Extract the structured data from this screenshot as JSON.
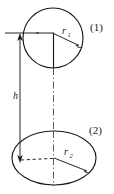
{
  "figure": {
    "type": "engineering-cross-section-diagram",
    "background_color": "#ffffff",
    "line_color": "#1a1a1a",
    "width": 114,
    "height": 194
  },
  "labels": {
    "section_top": "(1)",
    "section_bottom": "(2)",
    "height_symbol": "h",
    "radius_top_symbol": "r",
    "radius_top_subscript": "1",
    "radius_bottom_symbol": "r",
    "radius_bottom_subscript": "2"
  },
  "shapes": {
    "top_circle": {
      "name": "section-1-circle",
      "center_x": 53,
      "center_y": 38,
      "radius": 30
    },
    "bottom_ellipse": {
      "name": "section-2-ellipse",
      "center_x": 54,
      "center_y": 158,
      "radius_x": 42,
      "radius_y": 27
    }
  },
  "dimensions": {
    "height_line": {
      "name": "height-dimension-h",
      "x": 20,
      "y_top": 35,
      "y_bottom": 159,
      "arrow_top": "up",
      "arrow_bottom": "down"
    },
    "radius_top": {
      "name": "radius-r1-arrow",
      "from_x": 53,
      "from_y": 33,
      "to_x": 82,
      "to_y": 47
    },
    "radius_bottom": {
      "name": "radius-r2-arrow",
      "from_x": 54,
      "from_y": 158,
      "to_x": 90,
      "to_y": 173
    },
    "extension_top": {
      "name": "top-extension-line",
      "x1": 5,
      "x2": 54,
      "y": 33
    },
    "dashed_base": {
      "name": "bottom-dashed-leader",
      "x1": 20,
      "y1": 160,
      "x2": 54,
      "y2": 158
    },
    "center_axis": {
      "name": "center-axis-dashdot",
      "x": 53.5,
      "y_top": 38,
      "y_bottom": 158
    }
  }
}
